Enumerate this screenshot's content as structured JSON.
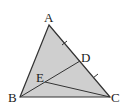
{
  "diagram": {
    "type": "geometry-triangle",
    "fill_color": "#cfcfcf",
    "stroke_color": "#333333",
    "points": {
      "A": {
        "label": "A",
        "x": 49,
        "y": 25
      },
      "B": {
        "label": "B",
        "x": 20,
        "y": 97
      },
      "C": {
        "label": "C",
        "x": 110,
        "y": 97
      },
      "D": {
        "label": "D",
        "x": 80,
        "y": 61
      },
      "E": {
        "label": "E",
        "x": 45,
        "y": 82
      }
    },
    "segments": [
      "AB",
      "BC",
      "CA",
      "BD",
      "EC"
    ],
    "tick_marks": [
      "AD",
      "DC"
    ]
  }
}
